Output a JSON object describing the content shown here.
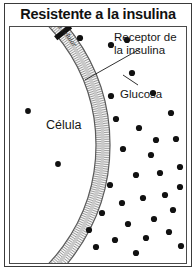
{
  "figure": {
    "title": "Resistente a la insulina",
    "labels": {
      "receptor": "Receptor de la insulina",
      "receptor_line1": "Receptor de",
      "receptor_line2": "la insulina",
      "glucosa": "Glucosa",
      "celula": "Célula",
      "membrana": "Membrana celular"
    },
    "colors": {
      "ink": "#111111",
      "frame": "#3a3a3a",
      "membrane_line": "#555555",
      "membrane_fill": "#f2f2f2",
      "receptor_block": "#111111",
      "glucose_dot": "#111111",
      "background": "#ffffff"
    },
    "diagram": {
      "description": "Corte de una célula con su membrana; los receptores de insulina aparecen bloqueados y la glucosa se acumula fuera de la célula.",
      "membrane": {
        "center_x": -86,
        "center_y": 118,
        "inner_radius": 172,
        "outer_radius": 186,
        "start_angle_deg": -72,
        "end_angle_deg": 72
      },
      "receptors": [
        {
          "name": "receptor-top",
          "angle_deg": -39
        },
        {
          "name": "receptor-bottom",
          "angle_deg": 55
        }
      ],
      "leaders": [
        {
          "name": "receptor-leader",
          "x1": 130,
          "y1": 22,
          "x2": 75,
          "y2": 53
        },
        {
          "name": "glucosa-leader",
          "x1": 128,
          "y1": 58,
          "x2": 113,
          "y2": 48
        }
      ],
      "glucose_outside": [
        [
          70,
          11
        ],
        [
          101,
          18
        ],
        [
          117,
          13
        ],
        [
          122,
          46
        ],
        [
          101,
          69
        ],
        [
          143,
          66
        ],
        [
          106,
          92
        ],
        [
          129,
          101
        ],
        [
          161,
          86
        ],
        [
          113,
          122
        ],
        [
          141,
          128
        ],
        [
          166,
          112
        ],
        [
          126,
          148
        ],
        [
          150,
          146
        ],
        [
          100,
          158
        ],
        [
          170,
          140
        ],
        [
          112,
          176
        ],
        [
          133,
          171
        ],
        [
          155,
          168
        ],
        [
          92,
          186
        ],
        [
          118,
          197
        ],
        [
          144,
          192
        ],
        [
          163,
          183
        ],
        [
          79,
          203
        ],
        [
          105,
          213
        ],
        [
          136,
          211
        ],
        [
          159,
          205
        ],
        [
          86,
          220
        ],
        [
          126,
          226
        ],
        [
          170,
          160
        ],
        [
          171,
          219
        ],
        [
          146,
          113
        ]
      ],
      "glucose_inside": [
        [
          18,
          84
        ],
        [
          48,
          137
        ]
      ]
    }
  }
}
